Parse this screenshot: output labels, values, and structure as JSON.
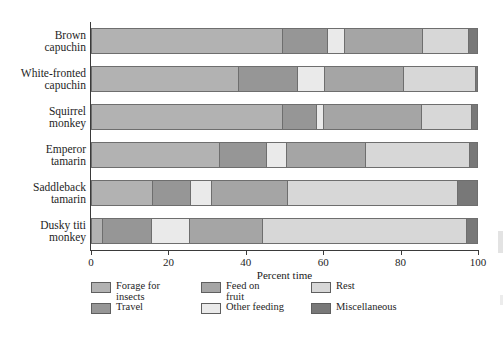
{
  "chart_data": {
    "type": "bar",
    "orientation": "horizontal",
    "stacked": true,
    "title": "",
    "xlabel": "Percent time",
    "ylabel": "",
    "xlim": [
      0,
      100
    ],
    "xticks": [
      0,
      20,
      40,
      60,
      80,
      100
    ],
    "grid": false,
    "legend_position": "bottom",
    "categories": [
      "Brown capuchin",
      "White-fronted capuchin",
      "Squirrel monkey",
      "Emperor tamarin",
      "Saddleback tamarin",
      "Dusky titi monkey"
    ],
    "category_lines": [
      [
        "Brown",
        "capuchin"
      ],
      [
        "White-fronted",
        "capuchin"
      ],
      [
        "Squirrel",
        "monkey"
      ],
      [
        "Emperor",
        "tamarin"
      ],
      [
        "Saddleback",
        "tamarin"
      ],
      [
        "Dusky titi",
        "monkey"
      ]
    ],
    "series": [
      {
        "name": "Forage for insects",
        "color": "#b2b2b2",
        "values": [
          49.4,
          38.0,
          49.4,
          33.1,
          15.8,
          2.8
        ]
      },
      {
        "name": "Travel",
        "color": "#969696",
        "values": [
          11.6,
          15.2,
          8.7,
          12.1,
          9.8,
          12.7
        ]
      },
      {
        "name": "Other feeding",
        "color": "#eaeaea",
        "values": [
          4.4,
          7.0,
          1.9,
          5.2,
          5.4,
          9.8
        ]
      },
      {
        "name": "Feed on fruit",
        "color": "#a5a5a5",
        "values": [
          20.1,
          20.4,
          25.3,
          20.4,
          19.6,
          18.9
        ]
      },
      {
        "name": "Rest",
        "color": "#d7d7d7",
        "values": [
          11.9,
          18.6,
          12.9,
          26.9,
          44.0,
          52.7
        ]
      },
      {
        "name": "Miscellaneous",
        "color": "#787878",
        "values": [
          2.6,
          0.8,
          1.8,
          2.3,
          5.4,
          3.1
        ]
      }
    ]
  },
  "legend": {
    "items": [
      {
        "label": "Forage for\ninsects",
        "color": "#b2b2b2",
        "name": "forage-for-insects"
      },
      {
        "label": "Feed on\nfruit",
        "color": "#a5a5a5",
        "name": "feed-on-fruit"
      },
      {
        "label": "Rest",
        "color": "#d7d7d7",
        "name": "rest"
      },
      {
        "label": "Travel",
        "color": "#969696",
        "name": "travel"
      },
      {
        "label": "Other feeding",
        "color": "#eaeaea",
        "name": "other-feeding"
      },
      {
        "label": "Miscellaneous",
        "color": "#787878",
        "name": "miscellaneous"
      }
    ]
  },
  "axis": {
    "x_title": "Percent time",
    "tick_labels": [
      "0",
      "20",
      "40",
      "60",
      "80",
      "100"
    ]
  }
}
